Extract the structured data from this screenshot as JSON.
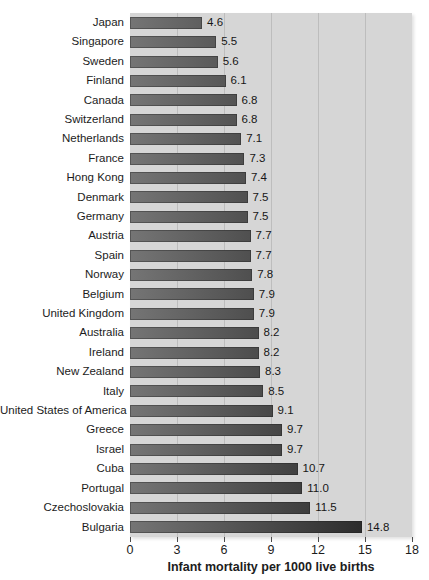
{
  "chart_data": {
    "type": "bar",
    "orientation": "horizontal",
    "title": "",
    "xlabel": "Infant mortality per 1000 live births",
    "ylabel": "",
    "xlim": [
      0,
      18
    ],
    "xticks": [
      0,
      3,
      6,
      9,
      12,
      15,
      18
    ],
    "gridlines": [
      3,
      6,
      9,
      12,
      15
    ],
    "grid": true,
    "legend": false,
    "categories": [
      "Japan",
      "Singapore",
      "Sweden",
      "Finland",
      "Canada",
      "Switzerland",
      "Netherlands",
      "France",
      "Hong Kong",
      "Denmark",
      "Germany",
      "Austria",
      "Spain",
      "Norway",
      "Belgium",
      "United Kingdom",
      "Australia",
      "Ireland",
      "New Zealand",
      "Italy",
      "United States of America",
      "Greece",
      "Israel",
      "Cuba",
      "Portugal",
      "Czechoslovakia",
      "Bulgaria"
    ],
    "values": [
      4.6,
      5.5,
      5.6,
      6.1,
      6.8,
      6.8,
      7.1,
      7.3,
      7.4,
      7.5,
      7.5,
      7.7,
      7.7,
      7.8,
      7.9,
      7.9,
      8.2,
      8.2,
      8.3,
      8.5,
      9.1,
      9.7,
      9.7,
      10.7,
      11.0,
      11.5,
      14.8
    ],
    "value_label_decimals": 1,
    "colors": {
      "plot_background": "#d6d6d6",
      "gridline": "#bdbdbd",
      "bar_gradient_start": "#757575",
      "bar_gradient_end": "#1d1d1d",
      "text": "#1c1c1c",
      "page_background": "#ffffff"
    }
  }
}
